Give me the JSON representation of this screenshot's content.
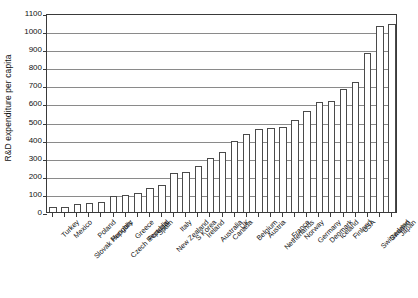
{
  "chart_data": {
    "type": "bar",
    "title": "",
    "xlabel": "",
    "ylabel": "R&D expenditure per capita",
    "ylim": [
      0,
      1100
    ],
    "ytick_step": 100,
    "yticks": [
      0,
      100,
      200,
      300,
      400,
      500,
      600,
      700,
      800,
      900,
      1000,
      1100
    ],
    "ytick_labels": [
      "0",
      "100",
      "200",
      "300",
      "400",
      "500",
      "600",
      "700",
      "800",
      "900",
      "1000",
      "1100"
    ],
    "grid": true,
    "grid_axis": "y",
    "legend": false,
    "legend_position": "none",
    "bar_fill": "#ffffff",
    "bar_edge": "#4a4a4a",
    "axis_color": "#3a3a3a",
    "grid_color": "#8a8a8a",
    "categories": [
      "Turkey",
      "Mexico",
      "Slovak Republic",
      "Poland",
      "Hungary",
      "Czech Republic",
      "Greece",
      "Portugal",
      "Spain",
      "New Zealand",
      "Italy",
      "S Korea",
      "Ireland",
      "Australia",
      "Canada",
      "UK",
      "Belgium",
      "Austria",
      "Netherlands",
      "France",
      "Norway",
      "Germany",
      "Denmark",
      "Iceland",
      "Finland",
      "USA",
      "Switzerland",
      "Sweden",
      "Japan"
    ],
    "values": [
      25,
      30,
      45,
      50,
      55,
      90,
      95,
      105,
      135,
      150,
      215,
      220,
      255,
      300,
      330,
      390,
      430,
      460,
      465,
      470,
      510,
      560,
      610,
      615,
      680,
      720,
      880,
      1030,
      1040
    ]
  }
}
